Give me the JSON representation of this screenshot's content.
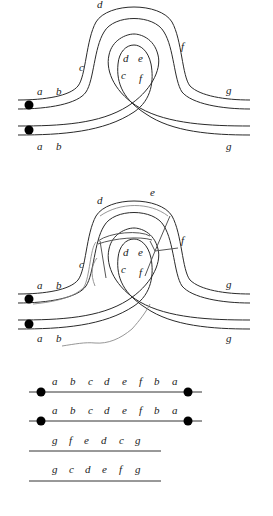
{
  "figure1": {
    "labels": {
      "top_left_a": "a",
      "top_left_b": "b",
      "bottom_left_a": "a",
      "bottom_left_b": "b",
      "arch_c": "c",
      "arch_d": "d",
      "arch_f": "f",
      "inner_d": "d",
      "inner_e": "e",
      "inner_c": "c",
      "inner_f": "f",
      "right_top_g": "g",
      "right_bottom_g": "g"
    }
  },
  "figure2": {
    "labels": {
      "top_left_a": "a",
      "top_left_b": "b",
      "bottom_left_a": "a",
      "bottom_left_b": "b",
      "arch_c": "c",
      "arch_d": "d",
      "arch_e": "e",
      "arch_f": "f",
      "inner_d": "d",
      "inner_e": "e",
      "inner_c": "c",
      "inner_f": "f",
      "right_top_g": "g",
      "right_bottom_g": "g"
    }
  },
  "sequences": [
    {
      "letters": [
        "a",
        "b",
        "c",
        "d",
        "e",
        "f",
        "b",
        "a"
      ],
      "endpoints": true
    },
    {
      "letters": [
        "a",
        "b",
        "c",
        "d",
        "e",
        "f",
        "b",
        "a"
      ],
      "endpoints": true
    },
    {
      "letters": [
        "g",
        "f",
        "e",
        "d",
        "c",
        "g"
      ],
      "endpoints": false
    },
    {
      "letters": [
        "g",
        "c",
        "d",
        "e",
        "f",
        "g"
      ],
      "endpoints": false
    }
  ]
}
